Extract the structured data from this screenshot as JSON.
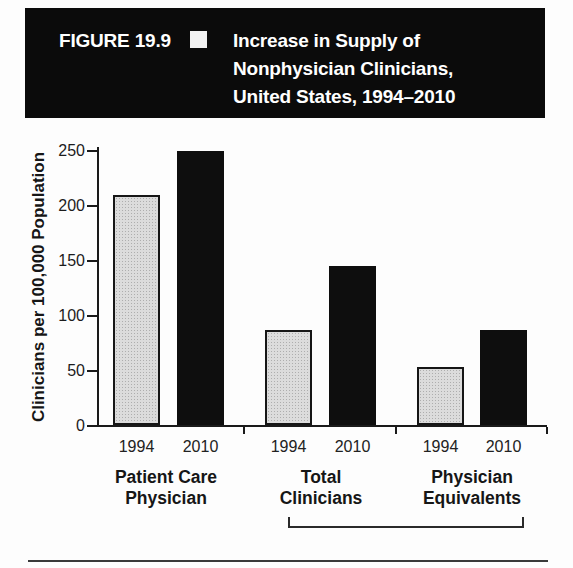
{
  "figure": {
    "label": "FIGURE 19.9",
    "title_lines": [
      "Increase in Supply of",
      "Nonphysician Clinicians,",
      "United States, 1994–2010"
    ]
  },
  "chart_data": {
    "type": "bar",
    "title": "Increase in Supply of Nonphysician Clinicians, United States, 1994–2010",
    "ylabel": "Clinicians per 100,000 Population",
    "xlabel": "",
    "ylim": [
      0,
      250
    ],
    "yticks": [
      0,
      50,
      100,
      150,
      200,
      250
    ],
    "grid": false,
    "legend_position": "none",
    "categories": [
      "Patient Care\nPhysician",
      "Total\nClinicians",
      "Physician\nEquivalents"
    ],
    "series": [
      {
        "name": "1994",
        "color": "#dcdcdc",
        "values": [
          209,
          86,
          53
        ]
      },
      {
        "name": "2010",
        "color": "#0e0e0e",
        "values": [
          249,
          145,
          86
        ]
      }
    ],
    "annotations": {
      "bracket_groups": [
        "Total Clinicians",
        "Physician Equivalents"
      ]
    }
  }
}
